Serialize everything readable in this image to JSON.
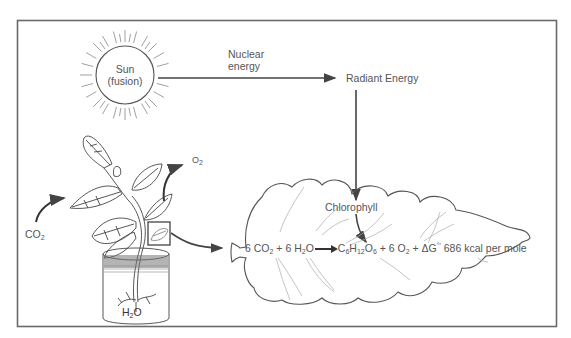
{
  "diagram": {
    "sun": {
      "line1": "Sun",
      "line2": "(fusion)"
    },
    "nuclear_energy": {
      "line1": "Nuclear",
      "line2": "energy"
    },
    "radiant_energy": "Radiant Energy",
    "chlorophyll": "Chlorophyll",
    "co2_label": {
      "base": "CO",
      "sub": "2"
    },
    "o2_label": {
      "base": "O",
      "sub": "2"
    },
    "h2o_label": {
      "a": "H",
      "sub": "2",
      "b": "O"
    },
    "equation": {
      "reactant1_coef": "6 CO",
      "reactant1_sub": "2",
      "plus1": " + ",
      "reactant2_coef": "6 H",
      "reactant2_sub": "2",
      "reactant2_tail": "O",
      "product1_c": "C",
      "product1_c_sub": "6",
      "product1_h": "H",
      "product1_h_sub": "12",
      "product1_o": "O",
      "product1_o_sub": "6",
      "plus2": " + 6 O",
      "product2_sub": "2",
      "plus3": " + ΔG",
      "delta_sup": "°′",
      "energy_value": " 686 kcal per mole"
    },
    "colors": {
      "line": "#4a4a4a",
      "frame": "#6a6a6a",
      "text": "#555555",
      "background": "#ffffff"
    }
  }
}
